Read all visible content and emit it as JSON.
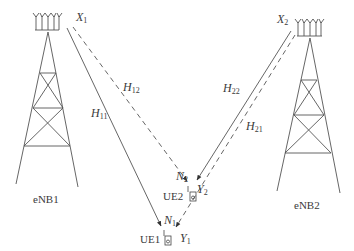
{
  "diagram": {
    "type": "wireless-interference-channel",
    "stroke_color": "#555555",
    "text_color": "#3a3a3a",
    "base_stations": [
      {
        "id": "eNB1",
        "label": "eNB1",
        "tx_symbol": "X",
        "tx_index": "1"
      },
      {
        "id": "eNB2",
        "label": "eNB2",
        "tx_symbol": "X",
        "tx_index": "2"
      }
    ],
    "user_equipment": [
      {
        "id": "UE1",
        "label": "UE1",
        "noise_symbol": "N",
        "noise_index": "1",
        "rx_symbol": "Y",
        "rx_index": "1"
      },
      {
        "id": "UE2",
        "label": "UE2",
        "noise_symbol": "N",
        "noise_index": "2",
        "rx_symbol": "Y",
        "rx_index": "2"
      }
    ],
    "channels": [
      {
        "from": "eNB1",
        "to": "UE1",
        "symbol": "H",
        "index": "11",
        "style": "solid"
      },
      {
        "from": "eNB1",
        "to": "UE2",
        "symbol": "H",
        "index": "12",
        "style": "dashed"
      },
      {
        "from": "eNB2",
        "to": "UE2",
        "symbol": "H",
        "index": "22",
        "style": "solid"
      },
      {
        "from": "eNB2",
        "to": "UE1",
        "symbol": "H",
        "index": "21",
        "style": "dashed"
      }
    ]
  }
}
